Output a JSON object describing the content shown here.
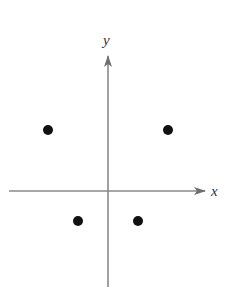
{
  "diagram": {
    "type": "coordinate-plane-points",
    "axes": {
      "x_label": "x",
      "y_label": "y",
      "color": "#7a7a7a",
      "origin_px": [
        108,
        191
      ],
      "x_axis_px": {
        "start": 9,
        "end": 205
      },
      "y_axis_px": {
        "start": 287,
        "end": 56
      }
    },
    "points": [
      {
        "id": "p1",
        "quadrant": "II",
        "px": [
          48,
          130
        ]
      },
      {
        "id": "p2",
        "quadrant": "I",
        "px": [
          168,
          130
        ]
      },
      {
        "id": "p3",
        "quadrant": "III",
        "px": [
          78,
          221
        ]
      },
      {
        "id": "p4",
        "quadrant": "IV",
        "px": [
          138,
          221
        ]
      }
    ],
    "point_color": "#111111",
    "point_radius": 5
  }
}
